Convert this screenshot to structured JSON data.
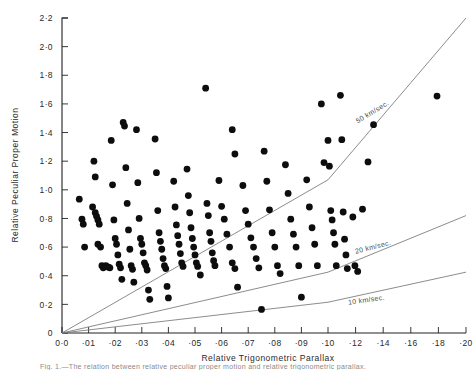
{
  "figure": {
    "title": "",
    "caption": "Fig. 1.—The relation between relative peculiar proper motion and relative trigonometric parallax."
  },
  "axes": {
    "x": {
      "title": "Relative Trigonometric Parallax",
      "ticks": [
        "0·0",
        "·01",
        "·02",
        "·03",
        "·04",
        "·05",
        "·06",
        "·07",
        "·08",
        "·09",
        "·10",
        "·12",
        "·14",
        "·16",
        "·18",
        "·20"
      ],
      "values": [
        0.0,
        0.01,
        0.02,
        0.03,
        0.04,
        0.05,
        0.06,
        0.07,
        0.08,
        0.09,
        0.1,
        0.12,
        0.14,
        0.16,
        0.18,
        0.2
      ],
      "scale": "piecewise-linear-compressed-after-0.10",
      "range": [
        0.0,
        0.2
      ]
    },
    "y": {
      "title": "Relative Peculiar Proper Motion",
      "ticks": [
        "0",
        "0·2",
        "0·4",
        "0·6",
        "0·8",
        "1·0",
        "1·2",
        "1·4",
        "1·6",
        "1·8",
        "2·0",
        "2·2"
      ],
      "values": [
        0.0,
        0.2,
        0.4,
        0.6,
        0.8,
        1.0,
        1.2,
        1.4,
        1.6,
        1.8,
        2.0,
        2.2
      ],
      "range": [
        0.0,
        2.2
      ]
    }
  },
  "colors": {
    "ink": "#0d0d0d",
    "axis": "#222222",
    "guide_line": "#777777",
    "background": "#ffffff"
  },
  "chart_data": {
    "type": "scatter",
    "title": "",
    "xlabel": "Relative Trigonometric Parallax",
    "ylabel": "Relative Peculiar Proper Motion",
    "xlim": [
      0.0,
      0.2
    ],
    "ylim": [
      0.0,
      2.2
    ],
    "grid": false,
    "legend": "inline-curve-labels",
    "marker": {
      "shape": "circle",
      "color": "#0d0d0d",
      "size": 3.4
    },
    "annotations": [
      {
        "text": "50 km/sec.",
        "x": 0.133,
        "y": 1.53,
        "rotation": -31
      },
      {
        "text": "20 km/sec.",
        "x": 0.133,
        "y": 0.585,
        "rotation": -14
      },
      {
        "text": "10 km/sec.",
        "x": 0.128,
        "y": 0.215,
        "rotation": -8
      }
    ],
    "series": [
      {
        "name": "50 km/sec.",
        "type": "line",
        "x": [
          0.0,
          0.1,
          0.2
        ],
        "y": [
          0.0,
          1.07,
          2.2
        ]
      },
      {
        "name": "20 km/sec.",
        "type": "line",
        "x": [
          0.0,
          0.1,
          0.2
        ],
        "y": [
          0.0,
          0.425,
          0.82
        ]
      },
      {
        "name": "10 km/sec.",
        "type": "line",
        "x": [
          0.0,
          0.1,
          0.2
        ],
        "y": [
          0.0,
          0.215,
          0.425
        ]
      },
      {
        "name": "stars",
        "type": "scatter",
        "points": [
          [
            0.0065,
            0.935
          ],
          [
            0.0075,
            0.795
          ],
          [
            0.008,
            0.76
          ],
          [
            0.0085,
            0.6
          ],
          [
            0.0115,
            0.88
          ],
          [
            0.0125,
            0.84
          ],
          [
            0.013,
            0.815
          ],
          [
            0.0135,
            0.79
          ],
          [
            0.014,
            0.76
          ],
          [
            0.0135,
            0.62
          ],
          [
            0.0145,
            0.6
          ],
          [
            0.015,
            0.47
          ],
          [
            0.0155,
            0.455
          ],
          [
            0.012,
            1.2
          ],
          [
            0.0125,
            1.09
          ],
          [
            0.0165,
            0.47
          ],
          [
            0.0175,
            0.46
          ],
          [
            0.018,
            0.455
          ],
          [
            0.0185,
            1.345
          ],
          [
            0.019,
            1.035
          ],
          [
            0.0195,
            0.79
          ],
          [
            0.02,
            0.66
          ],
          [
            0.0205,
            0.62
          ],
          [
            0.021,
            0.545
          ],
          [
            0.0215,
            0.48
          ],
          [
            0.022,
            0.455
          ],
          [
            0.0225,
            0.375
          ],
          [
            0.023,
            1.47
          ],
          [
            0.0235,
            1.445
          ],
          [
            0.024,
            1.155
          ],
          [
            0.0245,
            0.905
          ],
          [
            0.025,
            0.72
          ],
          [
            0.0255,
            0.585
          ],
          [
            0.026,
            0.47
          ],
          [
            0.0265,
            0.445
          ],
          [
            0.027,
            0.355
          ],
          [
            0.028,
            1.42
          ],
          [
            0.0285,
            1.05
          ],
          [
            0.029,
            0.8
          ],
          [
            0.0295,
            0.66
          ],
          [
            0.03,
            0.62
          ],
          [
            0.0305,
            0.56
          ],
          [
            0.031,
            0.49
          ],
          [
            0.0315,
            0.47
          ],
          [
            0.032,
            0.44
          ],
          [
            0.0325,
            0.3
          ],
          [
            0.033,
            0.235
          ],
          [
            0.035,
            1.355
          ],
          [
            0.0355,
            1.12
          ],
          [
            0.036,
            0.855
          ],
          [
            0.0365,
            0.7
          ],
          [
            0.037,
            0.64
          ],
          [
            0.0375,
            0.585
          ],
          [
            0.038,
            0.52
          ],
          [
            0.0385,
            0.47
          ],
          [
            0.039,
            0.45
          ],
          [
            0.0395,
            0.325
          ],
          [
            0.04,
            0.245
          ],
          [
            0.042,
            1.06
          ],
          [
            0.0425,
            0.88
          ],
          [
            0.043,
            0.755
          ],
          [
            0.0435,
            0.68
          ],
          [
            0.044,
            0.62
          ],
          [
            0.0445,
            0.555
          ],
          [
            0.045,
            0.49
          ],
          [
            0.0455,
            0.465
          ],
          [
            0.047,
            1.145
          ],
          [
            0.0475,
            0.96
          ],
          [
            0.048,
            0.84
          ],
          [
            0.0485,
            0.735
          ],
          [
            0.049,
            0.66
          ],
          [
            0.0495,
            0.6
          ],
          [
            0.05,
            0.545
          ],
          [
            0.0505,
            0.49
          ],
          [
            0.051,
            0.465
          ],
          [
            0.052,
            0.405
          ],
          [
            0.054,
            1.71
          ],
          [
            0.0545,
            0.905
          ],
          [
            0.055,
            0.82
          ],
          [
            0.0555,
            0.7
          ],
          [
            0.056,
            0.64
          ],
          [
            0.0565,
            0.56
          ],
          [
            0.057,
            0.505
          ],
          [
            0.0575,
            0.47
          ],
          [
            0.059,
            1.065
          ],
          [
            0.06,
            0.885
          ],
          [
            0.061,
            0.795
          ],
          [
            0.062,
            0.69
          ],
          [
            0.063,
            0.6
          ],
          [
            0.064,
            0.49
          ],
          [
            0.065,
            0.45
          ],
          [
            0.066,
            0.32
          ],
          [
            0.068,
            1.03
          ],
          [
            0.069,
            0.855
          ],
          [
            0.07,
            0.76
          ],
          [
            0.071,
            0.665
          ],
          [
            0.072,
            0.6
          ],
          [
            0.073,
            0.52
          ],
          [
            0.074,
            0.455
          ],
          [
            0.075,
            0.165
          ],
          [
            0.064,
            1.42
          ],
          [
            0.065,
            1.25
          ],
          [
            0.076,
            1.27
          ],
          [
            0.077,
            1.06
          ],
          [
            0.078,
            0.86
          ],
          [
            0.079,
            0.7
          ],
          [
            0.08,
            0.6
          ],
          [
            0.081,
            0.47
          ],
          [
            0.082,
            0.415
          ],
          [
            0.084,
            1.175
          ],
          [
            0.085,
            0.975
          ],
          [
            0.086,
            0.795
          ],
          [
            0.087,
            0.69
          ],
          [
            0.088,
            0.6
          ],
          [
            0.089,
            0.47
          ],
          [
            0.09,
            0.25
          ],
          [
            0.092,
            1.07
          ],
          [
            0.093,
            0.88
          ],
          [
            0.094,
            0.735
          ],
          [
            0.095,
            0.62
          ],
          [
            0.096,
            0.47
          ],
          [
            0.0975,
            1.6
          ],
          [
            0.0985,
            1.19
          ],
          [
            0.1,
            1.345
          ],
          [
            0.101,
            1.165
          ],
          [
            0.102,
            0.855
          ],
          [
            0.103,
            0.79
          ],
          [
            0.104,
            0.7
          ],
          [
            0.105,
            0.62
          ],
          [
            0.106,
            0.47
          ],
          [
            0.109,
            1.66
          ],
          [
            0.11,
            1.35
          ],
          [
            0.111,
            0.845
          ],
          [
            0.112,
            0.655
          ],
          [
            0.113,
            0.545
          ],
          [
            0.114,
            0.45
          ],
          [
            0.118,
            0.81
          ],
          [
            0.1195,
            0.47
          ],
          [
            0.1215,
            0.43
          ],
          [
            0.125,
            0.865
          ],
          [
            0.129,
            1.195
          ],
          [
            0.133,
            1.455
          ],
          [
            0.179,
            1.655
          ]
        ]
      }
    ]
  }
}
